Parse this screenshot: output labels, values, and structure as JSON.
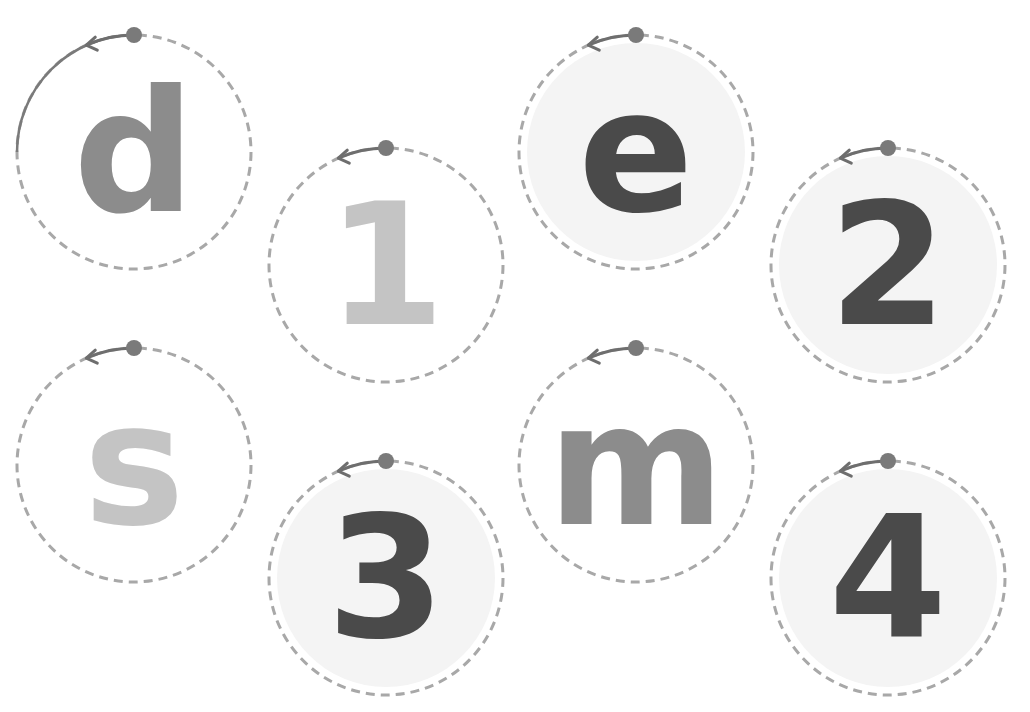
{
  "worksheet": {
    "colors": {
      "dashed_outline": "#a8a8a8",
      "start_dot": "#7a7a7a",
      "arrow": "#6e6e6e",
      "traced_arc": "#7a7a7a",
      "fill_shaded": "#f4f4f4",
      "glyph_dark": "#4a4a4a",
      "glyph_mid": "#8c8c8c",
      "glyph_light": "#c4c4c4"
    },
    "cards": [
      {
        "label": "d",
        "kind": "letter",
        "cx": 134,
        "cy": 152,
        "shade": "mid",
        "filled": false,
        "traced": true
      },
      {
        "label": "1",
        "kind": "number",
        "cx": 386,
        "cy": 265,
        "shade": "light",
        "filled": false,
        "traced": false
      },
      {
        "label": "e",
        "kind": "letter",
        "cx": 636,
        "cy": 152,
        "shade": "dark",
        "filled": true,
        "traced": false
      },
      {
        "label": "2",
        "kind": "number",
        "cx": 888,
        "cy": 265,
        "shade": "dark",
        "filled": true,
        "traced": false
      },
      {
        "label": "s",
        "kind": "letter",
        "cx": 134,
        "cy": 465,
        "shade": "light",
        "filled": false,
        "traced": false
      },
      {
        "label": "3",
        "kind": "number",
        "cx": 386,
        "cy": 578,
        "shade": "dark",
        "filled": true,
        "traced": false
      },
      {
        "label": "m",
        "kind": "letter",
        "cx": 636,
        "cy": 465,
        "shade": "mid",
        "filled": false,
        "traced": false
      },
      {
        "label": "4",
        "kind": "number",
        "cx": 888,
        "cy": 578,
        "shade": "dark",
        "filled": true,
        "traced": false
      }
    ]
  }
}
